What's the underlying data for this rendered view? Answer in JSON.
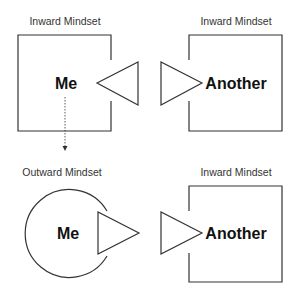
{
  "diagram": {
    "top_row": {
      "left": {
        "title": "Inward Mindset",
        "label": "Me"
      },
      "right": {
        "title": "Inward Mindset",
        "label": "Another"
      }
    },
    "bottom_row": {
      "left": {
        "title": "Outward Mindset",
        "label": "Me"
      },
      "right": {
        "title": "Inward Mindset",
        "label": "Another"
      }
    }
  },
  "colors": {
    "stroke": "#333333",
    "text": "#111111",
    "background": "#ffffff"
  }
}
